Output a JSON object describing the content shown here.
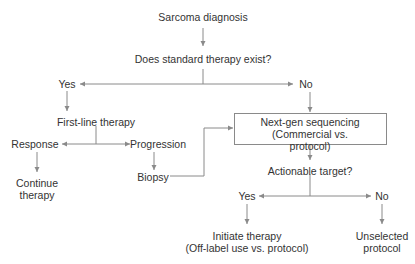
{
  "top_fragment": "",
  "nodes": {
    "sarcoma_diagnosis": "Sarcoma diagnosis",
    "standard_therapy_question": "Does standard therapy exist?",
    "yes_1": "Yes",
    "no_1": "No",
    "first_line_therapy": "First-line therapy",
    "response": "Response",
    "progression": "Progression",
    "continue_therapy": [
      "Continue",
      "therapy"
    ],
    "biopsy": "Biopsy",
    "ngs": [
      "Next-gen sequencing",
      "(Commercial vs. protocol)"
    ],
    "actionable_target_question": "Actionable target?",
    "yes_2": "Yes",
    "no_2": "No",
    "initiate_therapy": [
      "Initiate therapy",
      "(Off-label use vs. protocol)"
    ],
    "unselected_protocol": [
      "Unselected",
      "protocol"
    ]
  },
  "colors": {
    "line": "#8a8a8a",
    "text": "#333333"
  }
}
